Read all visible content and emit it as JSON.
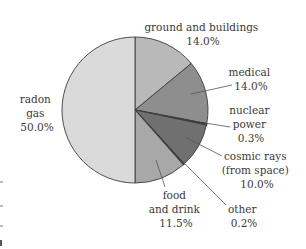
{
  "chart_data": {
    "type": "pie",
    "title": "",
    "start_angle_deg": 0,
    "direction": "clockwise",
    "center": [
      135,
      110
    ],
    "radius": 73,
    "slices": [
      {
        "name": "ground and buildings",
        "value": 14.0,
        "label": "14.0%",
        "color": "#b9b9b9"
      },
      {
        "name": "medical",
        "value": 14.0,
        "label": "14.0%",
        "color": "#8e8e8e"
      },
      {
        "name": "nuclear power",
        "value": 0.3,
        "label": "0.3%",
        "color": "#2e2e2e"
      },
      {
        "name": "cosmic rays (from space)",
        "value": 10.0,
        "label": "10.0%",
        "color": "#707070"
      },
      {
        "name": "other",
        "value": 0.2,
        "label": "0.2%",
        "color": "#2e2e2e"
      },
      {
        "name": "food and drink",
        "value": 11.5,
        "label": "11.5%",
        "color": "#a8a8a8"
      },
      {
        "name": "radon gas",
        "value": 50.0,
        "label": "50.0%",
        "color": "#dadada"
      }
    ],
    "legend": "none (labels placed beside slices with leader lines)"
  },
  "labels": {
    "ground": {
      "lines": [
        "ground and buildings",
        "14.0%"
      ]
    },
    "medical": {
      "lines": [
        "medical",
        "14.0%"
      ]
    },
    "nuclear": {
      "lines": [
        "nuclear",
        "power",
        "0.3%"
      ]
    },
    "cosmic": {
      "lines": [
        "cosmic rays",
        "(from space)",
        "10.0%"
      ]
    },
    "other": {
      "lines": [
        "other",
        "0.2%"
      ]
    },
    "food": {
      "lines": [
        "food",
        "and drink",
        "11.5%"
      ]
    },
    "radon": {
      "lines": [
        "radon",
        "gas",
        "50.0%"
      ]
    }
  }
}
